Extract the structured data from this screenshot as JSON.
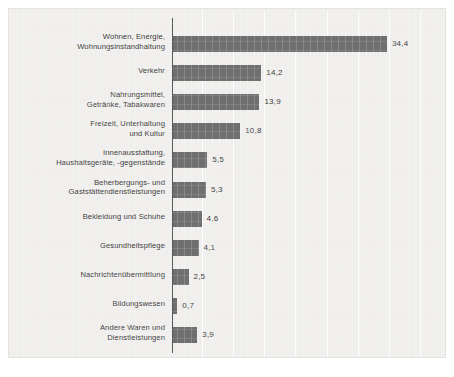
{
  "chart_data": {
    "type": "bar",
    "orientation": "horizontal",
    "title": "",
    "subtitle": "",
    "xlabel": "",
    "ylabel": "",
    "xlim": [
      0,
      40
    ],
    "grid": true,
    "grid_axis": "x",
    "grid_step": 5,
    "legend": "none",
    "value_label_format": "comma-decimal",
    "categories": [
      "Wohnen, Energie,\nWohnungsinstandhaltung",
      "Verkehr",
      "Nahrungsmittel,\nGetränke, Tabakwaren",
      "Freizeit, Unterhaltung\nund Kultur",
      "Innenausstattung,\nHaushaltsgeräte, -gegenstände",
      "Beherbergungs- und\nGaststättendienstleistungen",
      "Bekleidung und Schuhe",
      "Gesundheitspflege",
      "Nachrichtenübermittlung",
      "Bildungswesen",
      "Andere Waren und\nDienstleistungen"
    ],
    "values": [
      34.4,
      14.2,
      13.9,
      10.8,
      5.5,
      5.3,
      4.6,
      4.1,
      2.5,
      0.7,
      3.9
    ],
    "value_labels": [
      "34,4",
      "14,2",
      "13,9",
      "10,8",
      "5,5",
      "5,3",
      "4,6",
      "4,1",
      "2,5",
      "0,7",
      "3,9"
    ],
    "colors": {
      "bar": "#6f6f6f",
      "background": "#f0efed",
      "gridline": "#ffffff",
      "axis": "#585858",
      "text": "#3c3c3c"
    }
  },
  "rows": [
    {
      "label_line1": "Wohnen, Energie,",
      "label_line2": "Wohnungsinstandhaltung",
      "value": "34,4"
    },
    {
      "label_line1": "Verkehr",
      "label_line2": "",
      "value": "14,2"
    },
    {
      "label_line1": "Nahrungsmittel,",
      "label_line2": "Getränke, Tabakwaren",
      "value": "13,9"
    },
    {
      "label_line1": "Freizeit, Unterhaltung",
      "label_line2": "und Kultur",
      "value": "10,8"
    },
    {
      "label_line1": "Innenausstattung,",
      "label_line2": "Haushaltsgeräte, -gegenstände",
      "value": "5,5"
    },
    {
      "label_line1": "Beherbergungs- und",
      "label_line2": "Gaststättendienstleistungen",
      "value": "5,3"
    },
    {
      "label_line1": "Bekleidung und Schuhe",
      "label_line2": "",
      "value": "4,6"
    },
    {
      "label_line1": "Gesundheitspflege",
      "label_line2": "",
      "value": "4,1"
    },
    {
      "label_line1": "Nachrichtenübermittlung",
      "label_line2": "",
      "value": "2,5"
    },
    {
      "label_line1": "Bildungswesen",
      "label_line2": "",
      "value": "0,7"
    },
    {
      "label_line1": "Andere Waren und",
      "label_line2": "Dienstleistungen",
      "value": "3,9"
    }
  ]
}
